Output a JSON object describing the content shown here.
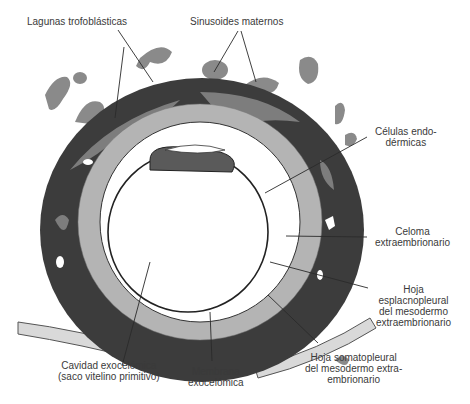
{
  "figure": {
    "type": "embryo-cross-section",
    "colors": {
      "background": "#ffffff",
      "trophoblast_dark": "#3c3c3c",
      "lacunae_gray": "#7d7d7d",
      "maternal_sinusoid": "#8a8a8a",
      "cytotrophoblast_light": "#b4b4b4",
      "cavity": "#ffffff",
      "line": "#2a2a2a"
    }
  },
  "labels": {
    "lagunas": [
      "Lagunas trofoblásticas"
    ],
    "sinusoides": [
      "Sinusoides maternos"
    ],
    "celulas_endo": [
      "Células endo-",
      "dérmicas"
    ],
    "celoma": [
      "Celoma",
      "extraembrionario"
    ],
    "hoja_esplac": [
      "Hoja",
      "esplacnopleural",
      "del mesodermo",
      "extraembrionario"
    ],
    "hoja_somato": [
      "Hoja somatopleural",
      "del mesodermo extra-",
      "embrionario"
    ],
    "cavidad": [
      "Cavidad exocelómica",
      "(saco vitelino primitivo)"
    ],
    "membrana": [
      "Membrana",
      "exocelómica"
    ]
  }
}
